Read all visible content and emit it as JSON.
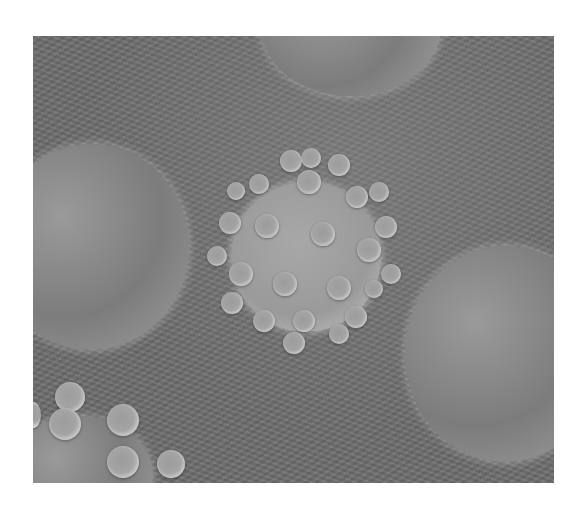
{
  "image": {
    "subject": "virus particle with surface spikes among cells",
    "palette": {
      "background": "#ffffff",
      "surface": "#6e6e6e",
      "highlight": "#f0f0f0"
    },
    "frame": {
      "x": 33,
      "y": 36,
      "width": 521,
      "height": 447
    }
  }
}
